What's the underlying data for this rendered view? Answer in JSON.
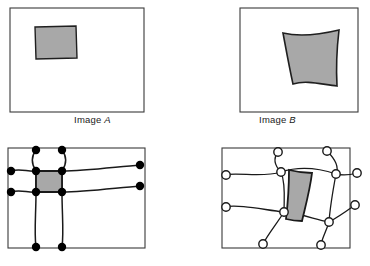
{
  "figure": {
    "background_color": "#ffffff",
    "width": 370,
    "height": 266,
    "stroke_color": "#333333",
    "shape_fill_color": "#a8a8a8",
    "shape_stroke_color": "#1a1a1a",
    "node_fill_filled": "#000000",
    "node_fill_open": "#ffffff"
  },
  "captions": {
    "image_a": {
      "prefix": "Image ",
      "label": "A"
    },
    "image_b": {
      "prefix": "Image ",
      "label": "B"
    }
  },
  "panels": [
    {
      "id": "panel-top-left",
      "name": "image-a-panel",
      "caption": "Image A",
      "frame": {
        "x": 10,
        "y": 8,
        "width": 134,
        "height": 104
      },
      "region": {
        "name": "source-region-quad",
        "fill": "#a8a8a8",
        "points": "35,27 76,26 77,58 36,59",
        "curved": false
      },
      "mesh": null
    },
    {
      "id": "panel-top-right",
      "name": "image-b-panel",
      "caption": "Image B",
      "frame": {
        "x": 240,
        "y": 8,
        "width": 118,
        "height": 104
      },
      "region": {
        "name": "warped-region-quad",
        "fill": "#a8a8a8",
        "points": "283,33 339,30 337,86 293,84",
        "curved": true
      },
      "mesh": null
    },
    {
      "id": "panel-bottom-left",
      "name": "image-a-mesh-panel",
      "caption": null,
      "frame": {
        "x": 8,
        "y": 148,
        "width": 137,
        "height": 100
      },
      "region": {
        "name": "source-mesh-cell",
        "fill": "#a8a8a8",
        "points": "36,171 62,171 62,192 36,192",
        "curved": false
      },
      "mesh": {
        "node_style": "filled",
        "node_radius": 4.2,
        "nodes": [
          {
            "x": 36,
            "y": 150,
            "name": "node-top-1"
          },
          {
            "x": 62,
            "y": 150,
            "name": "node-top-2"
          },
          {
            "x": 11,
            "y": 171,
            "name": "node-left-1"
          },
          {
            "x": 36,
            "y": 171,
            "name": "node-cell-tl"
          },
          {
            "x": 62,
            "y": 171,
            "name": "node-cell-tr"
          },
          {
            "x": 140,
            "y": 165,
            "name": "node-right-1"
          },
          {
            "x": 11,
            "y": 192,
            "name": "node-left-2"
          },
          {
            "x": 36,
            "y": 192,
            "name": "node-cell-bl"
          },
          {
            "x": 62,
            "y": 192,
            "name": "node-cell-br"
          },
          {
            "x": 140,
            "y": 186,
            "name": "node-right-2"
          },
          {
            "x": 36,
            "y": 247,
            "name": "node-bottom-1"
          },
          {
            "x": 62,
            "y": 247,
            "name": "node-bottom-2"
          }
        ]
      }
    },
    {
      "id": "panel-bottom-right",
      "name": "image-b-mesh-panel",
      "caption": null,
      "frame": {
        "x": 222,
        "y": 148,
        "width": 128,
        "height": 100
      },
      "region": {
        "name": "warped-mesh-cell",
        "fill": "#a8a8a8",
        "points": "289,170 312,173 302,221 286,219",
        "curved": true
      },
      "mesh": {
        "node_style": "open",
        "node_radius": 4.2,
        "nodes": [
          {
            "x": 278,
            "y": 152,
            "name": "node-top-1"
          },
          {
            "x": 327,
            "y": 151,
            "name": "node-top-2"
          },
          {
            "x": 226,
            "y": 175,
            "name": "node-left-1"
          },
          {
            "x": 281,
            "y": 172,
            "name": "node-cell-tl"
          },
          {
            "x": 336,
            "y": 174,
            "name": "node-cell-tr"
          },
          {
            "x": 357,
            "y": 173,
            "name": "node-right-1"
          },
          {
            "x": 226,
            "y": 207,
            "name": "node-left-2"
          },
          {
            "x": 284,
            "y": 212,
            "name": "node-cell-bl"
          },
          {
            "x": 329,
            "y": 222,
            "name": "node-cell-br"
          },
          {
            "x": 355,
            "y": 205,
            "name": "node-right-2"
          },
          {
            "x": 263,
            "y": 244,
            "name": "node-bottom-1"
          },
          {
            "x": 321,
            "y": 245,
            "name": "node-bottom-2"
          }
        ]
      }
    }
  ]
}
